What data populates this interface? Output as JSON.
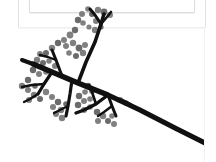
{
  "window": {
    "background_color": "#ffffff",
    "frame_border_color": "#e3e3e3",
    "inner_frame_border_color": "#dedede"
  },
  "scrollbar": {
    "orientation": "vertical",
    "thumb_color": "#8c8c8c",
    "track_color": "#ffffff",
    "thumb_top": 29,
    "thumb_height": 67
  },
  "artwork": {
    "title": "Stylized bare branch with berry clusters",
    "stroke_color": "#111111",
    "berry_color": "#6b6b6b",
    "berry_color_light": "#808080",
    "background": "#ffffff",
    "branches": [
      {
        "name": "main-stem",
        "points": "33,64 52,72 78,83 108,95 140,110 175,128 205,143",
        "width": 5.2
      },
      {
        "name": "main-stem-tip",
        "points": "175,128 205,143",
        "width": 3.2
      },
      {
        "name": "upper-left-limb",
        "points": "33,64 22,60",
        "width": 4.0
      },
      {
        "name": "upper-branch-a",
        "points": "78,83 86,62 95,42 101,24 104,14",
        "width": 3.6
      },
      {
        "name": "upper-branch-b",
        "points": "101,24 95,15 90,9",
        "width": 3.0
      },
      {
        "name": "upper-branch-c",
        "points": "101,24 107,17 111,12",
        "width": 2.6
      },
      {
        "name": "mid-branch-left",
        "points": "62,76 56,60 52,50",
        "width": 3.0
      },
      {
        "name": "mid-branch-left-twig",
        "points": "56,60 48,57 40,55",
        "width": 2.4
      },
      {
        "name": "lower-left-limb",
        "points": "52,72 44,84 38,94",
        "width": 3.2
      },
      {
        "name": "lower-left-twig-a",
        "points": "44,84 32,85 22,87",
        "width": 2.6
      },
      {
        "name": "lower-left-twig-b",
        "points": "38,94 30,99 24,102",
        "width": 2.4
      },
      {
        "name": "center-limb-down",
        "points": "72,80 70,94 68,106 66,116",
        "width": 3.2
      },
      {
        "name": "center-twig",
        "points": "68,106 60,110 54,113",
        "width": 2.4
      },
      {
        "name": "right-lower-limb",
        "points": "108,95 96,104 84,110 76,113",
        "width": 3.4
      },
      {
        "name": "right-lower-twig-a",
        "points": "96,104 92,92 89,85",
        "width": 2.6
      },
      {
        "name": "right-lower-twig-b",
        "points": "108,95 112,106 116,116",
        "width": 3.0
      },
      {
        "name": "right-lower-twig-c",
        "points": "112,106 104,112 98,116",
        "width": 2.4
      },
      {
        "name": "far-right-twig",
        "points": "140,110 130,104 122,100",
        "width": 2.6
      }
    ],
    "berries": [
      {
        "cx": 104,
        "cy": 12,
        "r": 3.4
      },
      {
        "cx": 110,
        "cy": 15,
        "r": 3.0
      },
      {
        "cx": 98,
        "cy": 10,
        "r": 3.2
      },
      {
        "cx": 92,
        "cy": 14,
        "r": 3.0
      },
      {
        "cx": 88,
        "cy": 9,
        "r": 2.8
      },
      {
        "cx": 82,
        "cy": 14,
        "r": 3.0
      },
      {
        "cx": 78,
        "cy": 20,
        "r": 3.2
      },
      {
        "cx": 83,
        "cy": 23,
        "r": 2.8
      },
      {
        "cx": 96,
        "cy": 21,
        "r": 3.0
      },
      {
        "cx": 101,
        "cy": 27,
        "r": 2.6
      },
      {
        "cx": 95,
        "cy": 30,
        "r": 3.2
      },
      {
        "cx": 89,
        "cy": 27,
        "r": 2.6
      },
      {
        "cx": 75,
        "cy": 30,
        "r": 3.2
      },
      {
        "cx": 70,
        "cy": 35,
        "r": 3.4
      },
      {
        "cx": 64,
        "cy": 40,
        "r": 3.0
      },
      {
        "cx": 58,
        "cy": 43,
        "r": 3.2
      },
      {
        "cx": 66,
        "cy": 46,
        "r": 3.0
      },
      {
        "cx": 73,
        "cy": 43,
        "r": 3.2
      },
      {
        "cx": 79,
        "cy": 48,
        "r": 3.4
      },
      {
        "cx": 85,
        "cy": 45,
        "r": 3.0
      },
      {
        "cx": 83,
        "cy": 53,
        "r": 3.2
      },
      {
        "cx": 76,
        "cy": 56,
        "r": 3.0
      },
      {
        "cx": 69,
        "cy": 53,
        "r": 2.8
      },
      {
        "cx": 52,
        "cy": 48,
        "r": 3.2
      },
      {
        "cx": 46,
        "cy": 53,
        "r": 3.0
      },
      {
        "cx": 40,
        "cy": 54,
        "r": 3.0
      },
      {
        "cx": 37,
        "cy": 60,
        "r": 3.2
      },
      {
        "cx": 43,
        "cy": 63,
        "r": 3.0
      },
      {
        "cx": 49,
        "cy": 61,
        "r": 2.8
      },
      {
        "cx": 55,
        "cy": 66,
        "r": 3.0
      },
      {
        "cx": 33,
        "cy": 70,
        "r": 3.2
      },
      {
        "cx": 39,
        "cy": 74,
        "r": 3.0
      },
      {
        "cx": 46,
        "cy": 72,
        "r": 2.8
      },
      {
        "cx": 28,
        "cy": 80,
        "r": 3.2
      },
      {
        "cx": 22,
        "cy": 86,
        "r": 3.2
      },
      {
        "cx": 28,
        "cy": 90,
        "r": 3.0
      },
      {
        "cx": 35,
        "cy": 86,
        "r": 2.8
      },
      {
        "cx": 34,
        "cy": 95,
        "r": 3.2
      },
      {
        "cx": 29,
        "cy": 100,
        "r": 3.0
      },
      {
        "cx": 40,
        "cy": 99,
        "r": 3.0
      },
      {
        "cx": 46,
        "cy": 92,
        "r": 3.2
      },
      {
        "cx": 52,
        "cy": 97,
        "r": 3.0
      },
      {
        "cx": 58,
        "cy": 102,
        "r": 3.2
      },
      {
        "cx": 53,
        "cy": 107,
        "r": 3.0
      },
      {
        "cx": 61,
        "cy": 110,
        "r": 3.2
      },
      {
        "cx": 66,
        "cy": 104,
        "r": 2.8
      },
      {
        "cx": 56,
        "cy": 114,
        "r": 3.0
      },
      {
        "cx": 62,
        "cy": 118,
        "r": 3.2
      },
      {
        "cx": 88,
        "cy": 86,
        "r": 3.2
      },
      {
        "cx": 92,
        "cy": 91,
        "r": 3.0
      },
      {
        "cx": 85,
        "cy": 92,
        "r": 2.8
      },
      {
        "cx": 79,
        "cy": 96,
        "r": 3.2
      },
      {
        "cx": 84,
        "cy": 101,
        "r": 3.0
      },
      {
        "cx": 90,
        "cy": 99,
        "r": 2.8
      },
      {
        "cx": 78,
        "cy": 105,
        "r": 3.2
      },
      {
        "cx": 84,
        "cy": 110,
        "r": 3.0
      },
      {
        "cx": 90,
        "cy": 107,
        "r": 2.8
      },
      {
        "cx": 97,
        "cy": 112,
        "r": 3.2
      },
      {
        "cx": 103,
        "cy": 116,
        "r": 3.2
      },
      {
        "cx": 98,
        "cy": 121,
        "r": 3.0
      },
      {
        "cx": 108,
        "cy": 121,
        "r": 3.0
      },
      {
        "cx": 112,
        "cy": 116,
        "r": 2.8
      },
      {
        "cx": 114,
        "cy": 124,
        "r": 3.0
      },
      {
        "cx": 120,
        "cy": 100,
        "r": 3.0
      },
      {
        "cx": 126,
        "cy": 103,
        "r": 2.8
      }
    ]
  }
}
